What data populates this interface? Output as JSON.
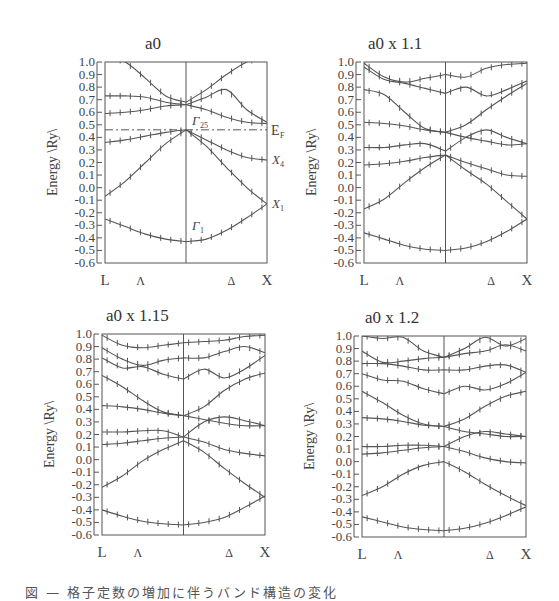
{
  "figure": {
    "caption": "図 — 格子定数の増加に伴うバンド構造の変化",
    "ylabel": "Energy \\Ry\\",
    "yticks": [
      "1.0",
      "0.9",
      "0.8",
      "0.7",
      "0.6",
      "0.5",
      "0.4",
      "0.3",
      "0.2",
      "0.1",
      "0.0",
      "-0.1",
      "-0.2",
      "-0.3",
      "-0.4",
      "-0.5",
      "-0.6"
    ],
    "xticks": [
      "L",
      "Λ",
      "Δ",
      "X"
    ]
  },
  "chart_data": [
    {
      "type": "line",
      "title": "a0",
      "xlabel": "",
      "ylabel": "Energy \\Ry\\",
      "x_ticks": [
        "L",
        "Λ",
        "Γ",
        "Δ",
        "X"
      ],
      "ylim": [
        -0.6,
        1.0
      ],
      "annotations": [
        "E_F (dash-dot line at 0.46)",
        "Γ25'",
        "X4'",
        "X1",
        "Γ1"
      ],
      "fermi_level": 0.46,
      "x": [
        0,
        0.125,
        0.25,
        0.375,
        0.5,
        0.625,
        0.75,
        0.875,
        1.0
      ],
      "series": [
        {
          "name": "band1",
          "values": [
            -0.25,
            -0.31,
            -0.37,
            -0.41,
            -0.43,
            -0.41,
            -0.34,
            -0.24,
            -0.13
          ]
        },
        {
          "name": "band2",
          "values": [
            -0.07,
            0.05,
            0.2,
            0.35,
            0.46,
            0.33,
            0.16,
            0.0,
            -0.13
          ]
        },
        {
          "name": "band3",
          "values": [
            0.36,
            0.38,
            0.41,
            0.44,
            0.46,
            0.38,
            0.3,
            0.24,
            0.22
          ]
        },
        {
          "name": "band4",
          "values": [
            0.59,
            0.6,
            0.62,
            0.65,
            0.66,
            0.62,
            0.56,
            0.52,
            0.51
          ]
        },
        {
          "name": "band5",
          "values": [
            0.73,
            0.73,
            0.72,
            0.68,
            0.66,
            0.72,
            0.78,
            0.62,
            0.52
          ]
        },
        {
          "name": "band6",
          "values": [
            1.05,
            1.0,
            0.87,
            0.73,
            0.68,
            0.78,
            0.9,
            1.0,
            1.05
          ]
        }
      ]
    },
    {
      "type": "line",
      "title": "a0 x 1.1",
      "xlabel": "",
      "ylabel": "Energy \\Ry\\",
      "x_ticks": [
        "L",
        "Λ",
        "Γ",
        "Δ",
        "X"
      ],
      "ylim": [
        -0.6,
        1.0
      ],
      "x": [
        0,
        0.125,
        0.25,
        0.375,
        0.5,
        0.625,
        0.75,
        0.875,
        1.0
      ],
      "series": [
        {
          "name": "band1",
          "values": [
            -0.36,
            -0.41,
            -0.46,
            -0.49,
            -0.5,
            -0.48,
            -0.43,
            -0.35,
            -0.25
          ]
        },
        {
          "name": "band2",
          "values": [
            -0.17,
            -0.09,
            0.04,
            0.16,
            0.26,
            0.14,
            0.03,
            -0.11,
            -0.25
          ]
        },
        {
          "name": "band3",
          "values": [
            0.18,
            0.19,
            0.21,
            0.24,
            0.26,
            0.2,
            0.15,
            0.1,
            0.09
          ]
        },
        {
          "name": "band4",
          "values": [
            0.32,
            0.32,
            0.34,
            0.35,
            0.29,
            0.4,
            0.46,
            0.4,
            0.35
          ]
        },
        {
          "name": "band5",
          "values": [
            0.52,
            0.51,
            0.49,
            0.46,
            0.44,
            0.4,
            0.37,
            0.34,
            0.35
          ]
        },
        {
          "name": "band6",
          "values": [
            0.78,
            0.74,
            0.6,
            0.47,
            0.44,
            0.5,
            0.62,
            0.73,
            0.83
          ]
        },
        {
          "name": "band7",
          "values": [
            0.96,
            0.86,
            0.83,
            0.79,
            0.75,
            0.8,
            0.73,
            0.78,
            0.85
          ]
        },
        {
          "name": "band8",
          "values": [
            0.99,
            0.88,
            0.84,
            0.87,
            0.9,
            0.88,
            0.95,
            0.98,
            0.99
          ]
        }
      ]
    },
    {
      "type": "line",
      "title": "a0 x 1.15",
      "xlabel": "",
      "ylabel": "Energy \\Ry\\",
      "x_ticks": [
        "L",
        "Λ",
        "Γ",
        "Δ",
        "X"
      ],
      "ylim": [
        -0.6,
        1.0
      ],
      "x": [
        0,
        0.125,
        0.25,
        0.375,
        0.5,
        0.625,
        0.75,
        0.875,
        1.0
      ],
      "series": [
        {
          "name": "band1",
          "values": [
            -0.4,
            -0.45,
            -0.49,
            -0.51,
            -0.52,
            -0.5,
            -0.46,
            -0.38,
            -0.29
          ]
        },
        {
          "name": "band2",
          "values": [
            -0.22,
            -0.13,
            -0.01,
            0.08,
            0.15,
            0.06,
            -0.07,
            -0.19,
            -0.3
          ]
        },
        {
          "name": "band3",
          "values": [
            0.12,
            0.13,
            0.15,
            0.17,
            0.18,
            0.14,
            0.08,
            0.05,
            0.03
          ]
        },
        {
          "name": "band4",
          "values": [
            0.22,
            0.22,
            0.23,
            0.23,
            0.18,
            0.3,
            0.34,
            0.31,
            0.27
          ]
        },
        {
          "name": "band5",
          "values": [
            0.43,
            0.42,
            0.4,
            0.37,
            0.35,
            0.32,
            0.29,
            0.27,
            0.27
          ]
        },
        {
          "name": "band6",
          "values": [
            0.67,
            0.58,
            0.47,
            0.38,
            0.35,
            0.42,
            0.55,
            0.64,
            0.69
          ]
        },
        {
          "name": "band7",
          "values": [
            0.81,
            0.73,
            0.74,
            0.68,
            0.64,
            0.72,
            0.65,
            0.72,
            0.83
          ]
        },
        {
          "name": "band8",
          "values": [
            0.89,
            0.8,
            0.75,
            0.79,
            0.81,
            0.81,
            0.86,
            0.9,
            0.85
          ]
        },
        {
          "name": "band9",
          "values": [
            0.99,
            0.91,
            0.89,
            0.91,
            0.93,
            0.94,
            0.95,
            0.98,
            0.99
          ]
        }
      ]
    },
    {
      "type": "line",
      "title": "a0 x 1.2",
      "xlabel": "",
      "ylabel": "Energy \\Ry\\",
      "x_ticks": [
        "L",
        "Λ",
        "Γ",
        "Δ",
        "X"
      ],
      "ylim": [
        -0.6,
        1.0
      ],
      "x": [
        0,
        0.125,
        0.25,
        0.375,
        0.5,
        0.625,
        0.75,
        0.875,
        1.0
      ],
      "series": [
        {
          "name": "band1",
          "values": [
            -0.44,
            -0.48,
            -0.52,
            -0.54,
            -0.55,
            -0.53,
            -0.49,
            -0.43,
            -0.36
          ]
        },
        {
          "name": "band2",
          "values": [
            -0.27,
            -0.2,
            -0.1,
            -0.03,
            0.0,
            -0.08,
            -0.18,
            -0.27,
            -0.35
          ]
        },
        {
          "name": "band3",
          "values": [
            0.06,
            0.07,
            0.09,
            0.11,
            0.12,
            0.08,
            0.03,
            0.0,
            -0.01
          ]
        },
        {
          "name": "band4",
          "values": [
            0.12,
            0.12,
            0.13,
            0.13,
            0.12,
            0.2,
            0.24,
            0.22,
            0.2
          ]
        },
        {
          "name": "band5",
          "values": [
            0.35,
            0.34,
            0.32,
            0.29,
            0.28,
            0.24,
            0.22,
            0.2,
            0.2
          ]
        },
        {
          "name": "band6",
          "values": [
            0.56,
            0.47,
            0.37,
            0.3,
            0.28,
            0.34,
            0.44,
            0.52,
            0.56
          ]
        },
        {
          "name": "band7",
          "values": [
            0.7,
            0.65,
            0.64,
            0.58,
            0.54,
            0.6,
            0.57,
            0.62,
            0.71
          ]
        },
        {
          "name": "band8",
          "values": [
            0.78,
            0.78,
            0.76,
            0.73,
            0.73,
            0.73,
            0.76,
            0.77,
            0.71
          ]
        },
        {
          "name": "band9",
          "values": [
            0.88,
            0.79,
            0.8,
            0.82,
            0.83,
            0.86,
            0.88,
            0.93,
            0.88
          ]
        },
        {
          "name": "band10",
          "values": [
            1.0,
            0.98,
            0.99,
            0.88,
            0.83,
            0.9,
            0.99,
            0.92,
            0.98
          ]
        }
      ]
    }
  ]
}
